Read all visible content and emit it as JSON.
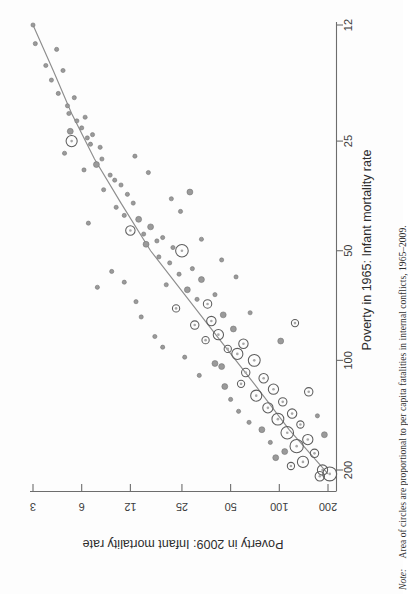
{
  "figure": {
    "orientation": "rotated-90-clockwise",
    "x_axis": {
      "title": "Poverty in 1965: Infant mortality rate",
      "ticks": [
        12,
        25,
        50,
        100,
        200
      ],
      "tick_labels": [
        "12",
        "25",
        "50",
        "100",
        "200"
      ],
      "scale": "log"
    },
    "y_axis": {
      "title": "Poverty in 2009: Infant mortality rate",
      "ticks": [
        3,
        6,
        12,
        25,
        50,
        100,
        200
      ],
      "tick_labels": [
        "3",
        "6",
        "12",
        "25",
        "50",
        "100",
        "200"
      ],
      "scale": "log"
    },
    "note_prefix": "Note:",
    "note_text": "Area of circles are proportional to per capita fatalities in internal conflicts, 1965–2009.",
    "colors": {
      "axis": "#6d6d6d",
      "marker_fill": "#9a9a9a",
      "marker_stroke": "#5d5d5d",
      "fit_line": "#8d8d8d",
      "text": "#2c2c2c",
      "background": "#fdfdfd"
    }
  },
  "chart_data": {
    "type": "scatter",
    "title": "",
    "xlabel": "Poverty in 1965: Infant mortality rate",
    "ylabel": "Poverty in 2009: Infant mortality rate",
    "xscale": "log",
    "yscale": "log",
    "xlim": [
      11,
      230
    ],
    "ylim": [
      2.7,
      230
    ],
    "xticks": [
      12,
      25,
      50,
      100,
      200
    ],
    "yticks": [
      3,
      6,
      12,
      25,
      50,
      100,
      200
    ],
    "grid": false,
    "legend": null,
    "size_encoding": "Area of circles proportional to per capita fatalities in internal conflicts, 1965-2009",
    "fit_line": {
      "name": "fitted trend",
      "x": [
        12,
        16,
        21,
        28,
        37,
        50,
        66,
        88,
        116,
        155,
        205
      ],
      "y": [
        3.0,
        4.0,
        5.2,
        7.2,
        10.5,
        16.0,
        26.0,
        43.0,
        70.0,
        115.0,
        200.0
      ]
    },
    "points": [
      {
        "x": 12.0,
        "y": 3.0,
        "s": 1
      },
      {
        "x": 13.5,
        "y": 3.1,
        "s": 1
      },
      {
        "x": 14.0,
        "y": 4.2,
        "s": 1
      },
      {
        "x": 15.5,
        "y": 3.6,
        "s": 1
      },
      {
        "x": 16.0,
        "y": 4.6,
        "s": 1
      },
      {
        "x": 17.0,
        "y": 3.9,
        "s": 1
      },
      {
        "x": 18.5,
        "y": 4.3,
        "s": 1
      },
      {
        "x": 19.0,
        "y": 5.4,
        "s": 1
      },
      {
        "x": 20.0,
        "y": 4.9,
        "s": 1
      },
      {
        "x": 21.0,
        "y": 5.0,
        "s": 1
      },
      {
        "x": 21.5,
        "y": 6.3,
        "s": 1
      },
      {
        "x": 22.0,
        "y": 5.6,
        "s": 1
      },
      {
        "x": 23.0,
        "y": 6.0,
        "s": 1
      },
      {
        "x": 23.5,
        "y": 5.1,
        "s": 2
      },
      {
        "x": 24.0,
        "y": 7.0,
        "s": 1
      },
      {
        "x": 24.5,
        "y": 6.5,
        "s": 1
      },
      {
        "x": 25.0,
        "y": 5.2,
        "s": 7
      },
      {
        "x": 25.5,
        "y": 6.8,
        "s": 1
      },
      {
        "x": 26.0,
        "y": 7.8,
        "s": 1
      },
      {
        "x": 27.0,
        "y": 4.7,
        "s": 1
      },
      {
        "x": 28.0,
        "y": 8.0,
        "s": 1
      },
      {
        "x": 29.0,
        "y": 7.4,
        "s": 2
      },
      {
        "x": 30.0,
        "y": 6.2,
        "s": 1
      },
      {
        "x": 31.0,
        "y": 9.0,
        "s": 1
      },
      {
        "x": 32.0,
        "y": 9.6,
        "s": 1
      },
      {
        "x": 33.0,
        "y": 10.5,
        "s": 1
      },
      {
        "x": 34.0,
        "y": 8.2,
        "s": 1
      },
      {
        "x": 35.0,
        "y": 11.5,
        "s": 1
      },
      {
        "x": 37.0,
        "y": 12.5,
        "s": 1
      },
      {
        "x": 38.0,
        "y": 9.8,
        "s": 1
      },
      {
        "x": 40.0,
        "y": 11.0,
        "s": 1
      },
      {
        "x": 41.0,
        "y": 13.5,
        "s": 2
      },
      {
        "x": 43.0,
        "y": 16.0,
        "s": 2
      },
      {
        "x": 44.0,
        "y": 12.0,
        "s": 5
      },
      {
        "x": 45.0,
        "y": 14.5,
        "s": 1
      },
      {
        "x": 46.0,
        "y": 19.0,
        "s": 1
      },
      {
        "x": 47.0,
        "y": 17.5,
        "s": 1
      },
      {
        "x": 48.0,
        "y": 15.0,
        "s": 2
      },
      {
        "x": 49.0,
        "y": 22.0,
        "s": 1
      },
      {
        "x": 50.0,
        "y": 25.0,
        "s": 9
      },
      {
        "x": 52.0,
        "y": 18.0,
        "s": 1
      },
      {
        "x": 54.0,
        "y": 21.0,
        "s": 1
      },
      {
        "x": 56.0,
        "y": 29.0,
        "s": 1
      },
      {
        "x": 58.0,
        "y": 24.0,
        "s": 1
      },
      {
        "x": 60.0,
        "y": 33.0,
        "s": 2
      },
      {
        "x": 62.0,
        "y": 20.0,
        "s": 1
      },
      {
        "x": 64.0,
        "y": 27.0,
        "s": 2
      },
      {
        "x": 66.0,
        "y": 40.0,
        "s": 1
      },
      {
        "x": 68.0,
        "y": 31.0,
        "s": 1
      },
      {
        "x": 70.0,
        "y": 36.0,
        "s": 4
      },
      {
        "x": 72.0,
        "y": 23.0,
        "s": 3
      },
      {
        "x": 75.0,
        "y": 45.0,
        "s": 2
      },
      {
        "x": 78.0,
        "y": 38.0,
        "s": 5
      },
      {
        "x": 80.0,
        "y": 30.0,
        "s": 4
      },
      {
        "x": 82.0,
        "y": 52.0,
        "s": 2
      },
      {
        "x": 85.0,
        "y": 42.0,
        "s": 6
      },
      {
        "x": 88.0,
        "y": 35.0,
        "s": 3
      },
      {
        "x": 90.0,
        "y": 60.0,
        "s": 5
      },
      {
        "x": 93.0,
        "y": 48.0,
        "s": 3
      },
      {
        "x": 96.0,
        "y": 55.0,
        "s": 7
      },
      {
        "x": 100.0,
        "y": 70.0,
        "s": 8
      },
      {
        "x": 104.0,
        "y": 44.0,
        "s": 2
      },
      {
        "x": 108.0,
        "y": 62.0,
        "s": 4
      },
      {
        "x": 112.0,
        "y": 80.0,
        "s": 5
      },
      {
        "x": 116.0,
        "y": 58.0,
        "s": 3
      },
      {
        "x": 120.0,
        "y": 92.0,
        "s": 6
      },
      {
        "x": 125.0,
        "y": 72.0,
        "s": 7
      },
      {
        "x": 130.0,
        "y": 105.0,
        "s": 4
      },
      {
        "x": 135.0,
        "y": 85.0,
        "s": 6
      },
      {
        "x": 140.0,
        "y": 120.0,
        "s": 5
      },
      {
        "x": 145.0,
        "y": 98.0,
        "s": 8
      },
      {
        "x": 150.0,
        "y": 135.0,
        "s": 3
      },
      {
        "x": 158.0,
        "y": 112.0,
        "s": 9
      },
      {
        "x": 165.0,
        "y": 150.0,
        "s": 6
      },
      {
        "x": 172.0,
        "y": 128.0,
        "s": 10
      },
      {
        "x": 180.0,
        "y": 165.0,
        "s": 4
      },
      {
        "x": 190.0,
        "y": 140.0,
        "s": 7
      },
      {
        "x": 200.0,
        "y": 185.0,
        "s": 6
      },
      {
        "x": 205.0,
        "y": 205.0,
        "s": 11
      },
      {
        "x": 208.0,
        "y": 178.0,
        "s": 5
      },
      {
        "x": 195.0,
        "y": 118.0,
        "s": 3
      },
      {
        "x": 185.0,
        "y": 95.0,
        "s": 2
      },
      {
        "x": 178.0,
        "y": 108.0,
        "s": 2
      },
      {
        "x": 168.0,
        "y": 88.0,
        "s": 1
      },
      {
        "x": 155.0,
        "y": 78.0,
        "s": 2
      },
      {
        "x": 148.0,
        "y": 65.0,
        "s": 1
      },
      {
        "x": 138.0,
        "y": 56.0,
        "s": 1
      },
      {
        "x": 128.0,
        "y": 50.0,
        "s": 1
      },
      {
        "x": 118.0,
        "y": 46.0,
        "s": 2
      },
      {
        "x": 110.0,
        "y": 32.0,
        "s": 1
      },
      {
        "x": 98.0,
        "y": 26.0,
        "s": 1
      },
      {
        "x": 92.0,
        "y": 19.0,
        "s": 1
      },
      {
        "x": 86.0,
        "y": 17.0,
        "s": 1
      },
      {
        "x": 76.0,
        "y": 14.0,
        "s": 1
      },
      {
        "x": 69.0,
        "y": 13.0,
        "s": 1
      },
      {
        "x": 61.0,
        "y": 11.0,
        "s": 1
      },
      {
        "x": 57.0,
        "y": 9.2,
        "s": 1
      },
      {
        "x": 53.0,
        "y": 44.0,
        "s": 1
      },
      {
        "x": 63.0,
        "y": 7.5,
        "s": 1
      },
      {
        "x": 42.0,
        "y": 6.6,
        "s": 1
      },
      {
        "x": 36.0,
        "y": 21.5,
        "s": 1
      },
      {
        "x": 30.5,
        "y": 15.5,
        "s": 1
      },
      {
        "x": 27.5,
        "y": 12.8,
        "s": 1
      },
      {
        "x": 34.5,
        "y": 28.0,
        "s": 2
      },
      {
        "x": 39.0,
        "y": 24.5,
        "s": 1
      },
      {
        "x": 46.5,
        "y": 33.0,
        "s": 1
      },
      {
        "x": 59.0,
        "y": 54.0,
        "s": 1
      },
      {
        "x": 74.0,
        "y": 66.0,
        "s": 1
      },
      {
        "x": 102.0,
        "y": 40.0,
        "s": 2
      },
      {
        "x": 122.0,
        "y": 152.0,
        "s": 4
      },
      {
        "x": 160.0,
        "y": 190.0,
        "s": 2
      },
      {
        "x": 142.0,
        "y": 172.0,
        "s": 1
      },
      {
        "x": 88.5,
        "y": 102.0,
        "s": 2
      },
      {
        "x": 79.0,
        "y": 125.0,
        "s": 3
      }
    ]
  }
}
